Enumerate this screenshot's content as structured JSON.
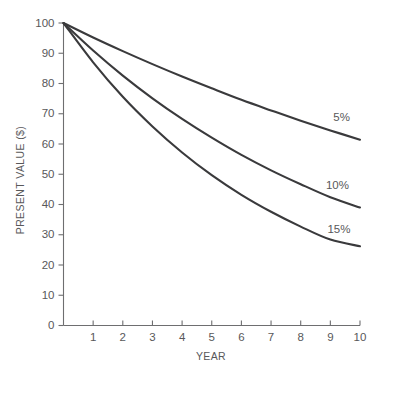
{
  "chart_data": {
    "type": "line",
    "title": "",
    "subtitle": "",
    "xlabel": "YEAR",
    "ylabel": "PRESENT VALUE ($)",
    "xlim": [
      0,
      10
    ],
    "ylim": [
      0,
      100
    ],
    "grid": false,
    "legend_position": "inline-right-of-curve-ends",
    "x": [
      0,
      1,
      2,
      3,
      4,
      5,
      6,
      7,
      8,
      9,
      10
    ],
    "xticks": [
      0,
      1,
      2,
      3,
      4,
      5,
      6,
      7,
      8,
      9,
      10
    ],
    "xticklabels": [
      "",
      "1",
      "2",
      "3",
      "4",
      "5",
      "6",
      "7",
      "8",
      "9",
      "10"
    ],
    "yticks": [
      0,
      10,
      20,
      30,
      40,
      50,
      60,
      70,
      80,
      90,
      100
    ],
    "yticklabels": [
      "0",
      "10",
      "20",
      "30",
      "40",
      "50",
      "60",
      "70",
      "80",
      "90",
      "100"
    ],
    "series": [
      {
        "name": "5%",
        "label": "5%",
        "color": "#3a3a3c",
        "values": [
          100.0,
          95.2,
          90.7,
          86.4,
          82.3,
          78.4,
          74.6,
          71.1,
          67.7,
          64.5,
          61.4
        ]
      },
      {
        "name": "10%",
        "label": "10%",
        "color": "#3a3a3c",
        "values": [
          100.0,
          90.9,
          82.6,
          75.1,
          68.3,
          62.1,
          56.4,
          51.3,
          46.7,
          42.4,
          39.0
        ]
      },
      {
        "name": "15%",
        "label": "15%",
        "color": "#3a3a3c",
        "values": [
          100.0,
          87.0,
          75.6,
          65.8,
          57.2,
          49.7,
          43.2,
          37.6,
          32.7,
          28.4,
          26.2
        ]
      }
    ],
    "annotations": [
      {
        "text": "5%",
        "x": 9.1,
        "y": 68.5
      },
      {
        "text": "10%",
        "x": 8.85,
        "y": 46.0
      },
      {
        "text": "15%",
        "x": 8.9,
        "y": 31.5
      }
    ]
  }
}
